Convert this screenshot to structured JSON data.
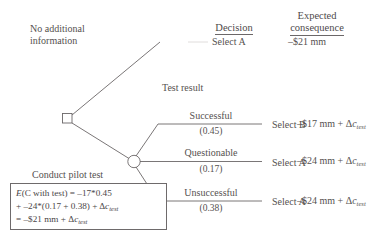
{
  "diagram": {
    "type": "decision-tree",
    "title_columns": {
      "decision_header": "Decision",
      "consequence_header_line1": "Expected",
      "consequence_header_line2": "consequence"
    },
    "nodes": {
      "decision_node": "decision-square",
      "chance_node": "chance-circle"
    },
    "top_branch": {
      "label_line1": "No additional",
      "label_line2": "information",
      "decision": "Select A",
      "consequence": "–$21 mm",
      "faded": true
    },
    "bottom_branch": {
      "label": "Conduct pilot test",
      "chance_group_label": "Test result"
    },
    "outcomes": [
      {
        "name": "Successful",
        "probability": "(0.45)",
        "prob_value": 0.45,
        "decision": "Select B",
        "consequence_prefix": "–$17 mm + Δ",
        "consequence_var": "c",
        "consequence_sub": "test"
      },
      {
        "name": "Questionable",
        "probability": "(0.17)",
        "prob_value": 0.17,
        "decision": "Select A",
        "consequence_prefix": "–$24 mm + Δ",
        "consequence_var": "c",
        "consequence_sub": "test"
      },
      {
        "name": "Unsuccessful",
        "probability": "(0.38)",
        "prob_value": 0.38,
        "decision": "Select A",
        "consequence_prefix": "–$24 mm + Δ",
        "consequence_var": "c",
        "consequence_sub": "test"
      }
    ],
    "formula_box": {
      "line1_a": "E",
      "line1_b": "(C with test) = –17*0.45",
      "line2_a": "+ –24*(0.17 + 0.38) + Δ",
      "line2_var": "c",
      "line2_sub": "test",
      "line3_a": "= –$21 mm + Δ",
      "line3_var": "c",
      "line3_sub": "test"
    },
    "colors": {
      "line": "#6b6768",
      "text": "#55514f",
      "faded_text": "#c9c6c5",
      "background": "#ffffff"
    }
  }
}
